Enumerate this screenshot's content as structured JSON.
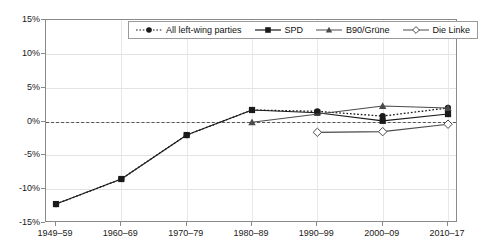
{
  "chart_data": {
    "type": "line",
    "title": "",
    "xlabel": "",
    "ylabel": "",
    "ylim": [
      -15,
      15
    ],
    "ytick_values": [
      15,
      10,
      5,
      0,
      -5,
      -10,
      -15
    ],
    "ytick_labels": [
      "15%",
      "10%",
      "5%",
      "0%",
      "-5%",
      "-10%",
      "-15%"
    ],
    "grid": true,
    "zero_reference_line": true,
    "legend_position": "top-center",
    "categories": [
      "1949–59",
      "1960–69",
      "1970–79",
      "1980–89",
      "1990–99",
      "2000–09",
      "2010–17"
    ],
    "series": [
      {
        "name": "All left-wing parties",
        "line_style": "dotted",
        "marker": "filled-circle",
        "color": "#1a1a1a",
        "values": [
          -12.2,
          -8.5,
          -2.0,
          1.7,
          1.5,
          0.8,
          2.0
        ]
      },
      {
        "name": "SPD",
        "line_style": "solid",
        "marker": "filled-square",
        "color": "#1a1a1a",
        "values": [
          -12.2,
          -8.5,
          -2.0,
          1.7,
          1.3,
          0.1,
          1.1
        ]
      },
      {
        "name": "B90/Grüne",
        "line_style": "solid",
        "marker": "filled-triangle",
        "color": "#4a4a4a",
        "values": [
          null,
          null,
          null,
          -0.1,
          null,
          2.3,
          2.0
        ]
      },
      {
        "name": "Die Linke",
        "line_style": "solid",
        "marker": "open-diamond",
        "color": "#4a4a4a",
        "values": [
          null,
          null,
          null,
          null,
          -1.6,
          -1.5,
          -0.4
        ]
      }
    ]
  },
  "legend": {
    "entries": [
      {
        "label": "All left-wing parties"
      },
      {
        "label": "SPD"
      },
      {
        "label": "B90/Grüne"
      },
      {
        "label": "Die Linke"
      }
    ]
  }
}
